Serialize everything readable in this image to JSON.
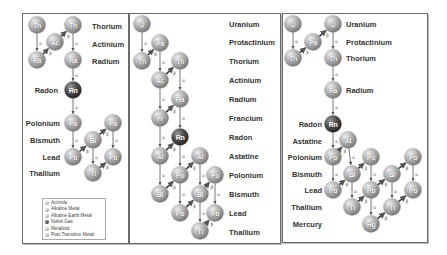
{
  "panels": [
    {
      "name": "thorium-series",
      "element_labels": [
        {
          "text": "Thorium",
          "x": 92,
          "y": 26
        },
        {
          "text": "Actinium",
          "x": 92,
          "y": 44
        },
        {
          "text": "Radium",
          "x": 92,
          "y": 61
        },
        {
          "text": "Radon",
          "x": 58,
          "y": 90,
          "align": "right"
        },
        {
          "text": "Polonium",
          "x": 60,
          "y": 123,
          "align": "right"
        },
        {
          "text": "Bismuth",
          "x": 60,
          "y": 140,
          "align": "right"
        },
        {
          "text": "Lead",
          "x": 60,
          "y": 157,
          "align": "right"
        },
        {
          "text": "Thallium",
          "x": 60,
          "y": 173,
          "align": "right"
        }
      ],
      "nodes": [
        {
          "sym": "Th",
          "x": 37,
          "y": 25
        },
        {
          "sym": "Th",
          "x": 73,
          "y": 25
        },
        {
          "sym": "Ac",
          "x": 55,
          "y": 42
        },
        {
          "sym": "Ra",
          "x": 37,
          "y": 60
        },
        {
          "sym": "Ra",
          "x": 73,
          "y": 60
        },
        {
          "sym": "Rn",
          "x": 73,
          "y": 90,
          "noble": true
        },
        {
          "sym": "Po",
          "x": 73,
          "y": 123
        },
        {
          "sym": "Po",
          "x": 113,
          "y": 123
        },
        {
          "sym": "Bi",
          "x": 93,
          "y": 140
        },
        {
          "sym": "Pb",
          "x": 73,
          "y": 157
        },
        {
          "sym": "Pb",
          "x": 113,
          "y": 157
        },
        {
          "sym": "Tl",
          "x": 93,
          "y": 173
        }
      ],
      "links": [
        {
          "from": [
            37,
            25
          ],
          "to": [
            37,
            60
          ],
          "type": "α"
        },
        {
          "from": [
            37,
            60
          ],
          "to": [
            55,
            42
          ],
          "type": "β"
        },
        {
          "from": [
            55,
            42
          ],
          "to": [
            73,
            25
          ],
          "type": "β"
        },
        {
          "from": [
            73,
            25
          ],
          "to": [
            73,
            60
          ],
          "type": "α"
        },
        {
          "from": [
            73,
            60
          ],
          "to": [
            73,
            90
          ],
          "type": "α"
        },
        {
          "from": [
            73,
            90
          ],
          "to": [
            73,
            123
          ],
          "type": "α"
        },
        {
          "from": [
            73,
            123
          ],
          "to": [
            73,
            157
          ],
          "type": "α"
        },
        {
          "from": [
            73,
            157
          ],
          "to": [
            93,
            140
          ],
          "type": "β"
        },
        {
          "from": [
            93,
            140
          ],
          "to": [
            113,
            123
          ],
          "type": "β"
        },
        {
          "from": [
            93,
            140
          ],
          "to": [
            93,
            173
          ],
          "type": "α"
        },
        {
          "from": [
            113,
            123
          ],
          "to": [
            113,
            157
          ],
          "type": "α"
        },
        {
          "from": [
            93,
            173
          ],
          "to": [
            113,
            157
          ],
          "type": "β"
        }
      ]
    },
    {
      "name": "uranium-series",
      "element_labels": [
        {
          "text": "Uranium",
          "x": 229,
          "y": 24
        },
        {
          "text": "Protactinium",
          "x": 229,
          "y": 42
        },
        {
          "text": "Thorium",
          "x": 229,
          "y": 61
        },
        {
          "text": "Actinium",
          "x": 229,
          "y": 80
        },
        {
          "text": "Radium",
          "x": 229,
          "y": 99
        },
        {
          "text": "Francium",
          "x": 229,
          "y": 118
        },
        {
          "text": "Radon",
          "x": 229,
          "y": 137
        },
        {
          "text": "Astatine",
          "x": 229,
          "y": 156
        },
        {
          "text": "Polonium",
          "x": 229,
          "y": 175
        },
        {
          "text": "Bismuth",
          "x": 229,
          "y": 194
        },
        {
          "text": "Lead",
          "x": 229,
          "y": 213
        },
        {
          "text": "Thallium",
          "x": 229,
          "y": 232
        }
      ],
      "nodes": [
        {
          "sym": "U",
          "x": 142,
          "y": 24
        },
        {
          "sym": "Pa",
          "x": 160,
          "y": 43
        },
        {
          "sym": "Th",
          "x": 142,
          "y": 61
        },
        {
          "sym": "Th",
          "x": 180,
          "y": 61
        },
        {
          "sym": "Ac",
          "x": 160,
          "y": 80
        },
        {
          "sym": "Ra",
          "x": 180,
          "y": 99
        },
        {
          "sym": "Fr",
          "x": 160,
          "y": 118
        },
        {
          "sym": "Rn",
          "x": 180,
          "y": 137,
          "noble": true
        },
        {
          "sym": "At",
          "x": 160,
          "y": 156
        },
        {
          "sym": "At",
          "x": 200,
          "y": 156
        },
        {
          "sym": "Po",
          "x": 180,
          "y": 175
        },
        {
          "sym": "Po",
          "x": 215,
          "y": 175
        },
        {
          "sym": "Bi",
          "x": 160,
          "y": 194
        },
        {
          "sym": "Bi",
          "x": 200,
          "y": 194
        },
        {
          "sym": "Pb",
          "x": 180,
          "y": 213
        },
        {
          "sym": "Pb",
          "x": 215,
          "y": 213
        },
        {
          "sym": "Tl",
          "x": 200,
          "y": 231
        }
      ],
      "links": [
        {
          "from": [
            142,
            24
          ],
          "to": [
            142,
            61
          ],
          "type": "α"
        },
        {
          "from": [
            142,
            61
          ],
          "to": [
            160,
            43
          ],
          "type": "β"
        },
        {
          "from": [
            160,
            43
          ],
          "to": [
            160,
            80
          ],
          "type": "α"
        },
        {
          "from": [
            160,
            80
          ],
          "to": [
            180,
            61
          ],
          "type": "β"
        },
        {
          "from": [
            180,
            61
          ],
          "to": [
            180,
            99
          ],
          "type": "α"
        },
        {
          "from": [
            160,
            80
          ],
          "to": [
            160,
            118
          ],
          "type": "α"
        },
        {
          "from": [
            160,
            118
          ],
          "to": [
            180,
            99
          ],
          "type": "β"
        },
        {
          "from": [
            180,
            99
          ],
          "to": [
            180,
            137
          ],
          "type": "α"
        },
        {
          "from": [
            160,
            118
          ],
          "to": [
            160,
            156
          ],
          "type": "α"
        },
        {
          "from": [
            160,
            156
          ],
          "to": [
            180,
            137
          ],
          "type": "β"
        },
        {
          "from": [
            180,
            137
          ],
          "to": [
            180,
            175
          ],
          "type": "α"
        },
        {
          "from": [
            160,
            156
          ],
          "to": [
            160,
            194
          ],
          "type": "α"
        },
        {
          "from": [
            160,
            194
          ],
          "to": [
            180,
            175
          ],
          "type": "β"
        },
        {
          "from": [
            180,
            175
          ],
          "to": [
            180,
            213
          ],
          "type": "α"
        },
        {
          "from": [
            180,
            175
          ],
          "to": [
            200,
            156
          ],
          "type": "β"
        },
        {
          "from": [
            200,
            156
          ],
          "to": [
            200,
            194
          ],
          "type": "α"
        },
        {
          "from": [
            180,
            213
          ],
          "to": [
            200,
            194
          ],
          "type": "β"
        },
        {
          "from": [
            200,
            194
          ],
          "to": [
            215,
            175
          ],
          "type": "β"
        },
        {
          "from": [
            200,
            194
          ],
          "to": [
            200,
            231
          ],
          "type": "α"
        },
        {
          "from": [
            215,
            175
          ],
          "to": [
            215,
            213
          ],
          "type": "α"
        },
        {
          "from": [
            200,
            231
          ],
          "to": [
            215,
            213
          ],
          "type": "β"
        }
      ]
    },
    {
      "name": "actinium-series",
      "element_labels": [
        {
          "text": "Uranium",
          "x": 346,
          "y": 24
        },
        {
          "text": "Protactinium",
          "x": 346,
          "y": 42
        },
        {
          "text": "Thorium",
          "x": 346,
          "y": 58
        },
        {
          "text": "Radium",
          "x": 346,
          "y": 90
        },
        {
          "text": "Radon",
          "x": 322,
          "y": 124,
          "align": "right"
        },
        {
          "text": "Astatine",
          "x": 322,
          "y": 141,
          "align": "right"
        },
        {
          "text": "Polonium",
          "x": 322,
          "y": 157,
          "align": "right"
        },
        {
          "text": "Bismuth",
          "x": 322,
          "y": 174,
          "align": "right"
        },
        {
          "text": "Lead",
          "x": 322,
          "y": 190,
          "align": "right"
        },
        {
          "text": "Thallium",
          "x": 322,
          "y": 207,
          "align": "right"
        },
        {
          "text": "Mercury",
          "x": 322,
          "y": 224,
          "align": "right"
        }
      ],
      "nodes": [
        {
          "sym": "U",
          "x": 293,
          "y": 24
        },
        {
          "sym": "U",
          "x": 333,
          "y": 24
        },
        {
          "sym": "Pa",
          "x": 313,
          "y": 42
        },
        {
          "sym": "Th",
          "x": 293,
          "y": 58
        },
        {
          "sym": "Th",
          "x": 333,
          "y": 58
        },
        {
          "sym": "Ra",
          "x": 333,
          "y": 90
        },
        {
          "sym": "Rn",
          "x": 333,
          "y": 124,
          "noble": true
        },
        {
          "sym": "At",
          "x": 348,
          "y": 140
        },
        {
          "sym": "Po",
          "x": 333,
          "y": 157
        },
        {
          "sym": "Po",
          "x": 371,
          "y": 157
        },
        {
          "sym": "Po",
          "x": 413,
          "y": 157
        },
        {
          "sym": "Bi",
          "x": 352,
          "y": 174
        },
        {
          "sym": "Bi",
          "x": 392,
          "y": 174
        },
        {
          "sym": "Pb",
          "x": 333,
          "y": 190
        },
        {
          "sym": "Pb",
          "x": 371,
          "y": 190
        },
        {
          "sym": "Pb",
          "x": 413,
          "y": 190
        },
        {
          "sym": "Tl",
          "x": 352,
          "y": 207
        },
        {
          "sym": "Tl",
          "x": 392,
          "y": 207
        },
        {
          "sym": "Hg",
          "x": 371,
          "y": 224
        }
      ],
      "links": [
        {
          "from": [
            293,
            24
          ],
          "to": [
            293,
            58
          ],
          "type": "α"
        },
        {
          "from": [
            293,
            58
          ],
          "to": [
            313,
            42
          ],
          "type": "β"
        },
        {
          "from": [
            313,
            42
          ],
          "to": [
            333,
            24
          ],
          "type": "β"
        },
        {
          "from": [
            333,
            24
          ],
          "to": [
            333,
            58
          ],
          "type": "α"
        },
        {
          "from": [
            333,
            58
          ],
          "to": [
            333,
            90
          ],
          "type": "α"
        },
        {
          "from": [
            333,
            90
          ],
          "to": [
            333,
            124
          ],
          "type": "α"
        },
        {
          "from": [
            333,
            124
          ],
          "to": [
            333,
            157
          ],
          "type": "α"
        },
        {
          "from": [
            333,
            157
          ],
          "to": [
            348,
            140
          ],
          "type": "β"
        },
        {
          "from": [
            348,
            140
          ],
          "to": [
            352,
            174
          ],
          "type": "α"
        },
        {
          "from": [
            333,
            157
          ],
          "to": [
            333,
            190
          ],
          "type": "α"
        },
        {
          "from": [
            333,
            190
          ],
          "to": [
            352,
            174
          ],
          "type": "β"
        },
        {
          "from": [
            352,
            174
          ],
          "to": [
            371,
            157
          ],
          "type": "β"
        },
        {
          "from": [
            352,
            174
          ],
          "to": [
            352,
            207
          ],
          "type": "α"
        },
        {
          "from": [
            371,
            157
          ],
          "to": [
            371,
            190
          ],
          "type": "α"
        },
        {
          "from": [
            352,
            207
          ],
          "to": [
            371,
            190
          ],
          "type": "β"
        },
        {
          "from": [
            371,
            190
          ],
          "to": [
            392,
            174
          ],
          "type": "β"
        },
        {
          "from": [
            371,
            190
          ],
          "to": [
            371,
            224
          ],
          "type": "α"
        },
        {
          "from": [
            371,
            224
          ],
          "to": [
            392,
            207
          ],
          "type": "β"
        },
        {
          "from": [
            392,
            174
          ],
          "to": [
            413,
            157
          ],
          "type": "β"
        },
        {
          "from": [
            392,
            174
          ],
          "to": [
            392,
            207
          ],
          "type": "α"
        },
        {
          "from": [
            413,
            157
          ],
          "to": [
            413,
            190
          ],
          "type": "α"
        },
        {
          "from": [
            392,
            207
          ],
          "to": [
            413,
            190
          ],
          "type": "β"
        }
      ]
    }
  ],
  "legend": {
    "items": [
      {
        "label": "Actinide",
        "dark": false
      },
      {
        "label": "Alkaline Metal",
        "dark": false
      },
      {
        "label": "Alkaline Earth Metal",
        "dark": false
      },
      {
        "label": "Nobel Gas",
        "dark": true
      },
      {
        "label": "Metalloid",
        "dark": false
      },
      {
        "label": "Post Transition Metal",
        "dark": false
      }
    ]
  },
  "colors": {
    "node_light": "#9a9a9a",
    "node_noble": "#2a2a2a",
    "link": "#555555",
    "border": "#6b6b6b"
  }
}
